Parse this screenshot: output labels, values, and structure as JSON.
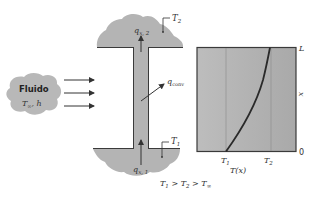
{
  "fluid": {
    "title": "Fluido",
    "params": "T∞, h",
    "t_label": "T",
    "t_sub": "∞",
    "h_label": "h"
  },
  "fin": {
    "top_base_temp": "T",
    "top_base_temp_sub": "2",
    "bottom_base_temp": "T",
    "bottom_base_temp_sub": "1",
    "q_top": "q",
    "q_top_sub": "x, 2",
    "q_bottom": "q",
    "q_bottom_sub": "x, 1",
    "q_conv": "q",
    "q_conv_sub": "conv"
  },
  "condition": {
    "text": "T1 > T2 > T∞",
    "parts": [
      "T",
      "1",
      " > ",
      "T",
      "2",
      " > ",
      "T",
      "∞"
    ]
  },
  "colors": {
    "solid_fill": "#b4b4b4",
    "graph_fill": "#b0b0b0",
    "stroke": "#3a3a3a",
    "curve": "#2a2a2a",
    "text": "#333333"
  },
  "chart_data": {
    "type": "line",
    "title": "",
    "xlabel": "T(x)",
    "ylabel": "x",
    "x_ticks": [
      "T1",
      "T2"
    ],
    "y_ticks": [
      "0",
      "L"
    ],
    "series": [
      {
        "name": "T(x)",
        "points": [
          {
            "x": "T1",
            "y": 0
          },
          {
            "x": 0.35,
            "y": 0.25
          },
          {
            "x": 0.6,
            "y": 0.5
          },
          {
            "x": 0.78,
            "y": 0.75
          },
          {
            "x": 0.92,
            "y": 1.0
          }
        ]
      }
    ],
    "grid": false
  }
}
